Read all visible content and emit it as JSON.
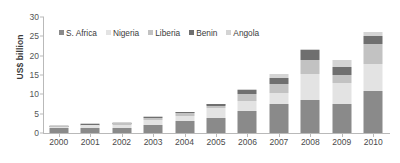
{
  "chart_data": {
    "type": "bar",
    "stacked": true,
    "title": "",
    "subtitle": "",
    "xlabel": "",
    "ylabel": "US$ billion",
    "ylim": [
      0,
      30
    ],
    "yticks": [
      0,
      5,
      10,
      15,
      20,
      25,
      30
    ],
    "grid": false,
    "legend_position": "top-left-inside",
    "categories": [
      "2000",
      "2001",
      "2002",
      "2003",
      "2004",
      "2005",
      "2006",
      "2007",
      "2008",
      "2009",
      "2010"
    ],
    "series": [
      {
        "name": "S. Africa",
        "color": "#8a8a8a",
        "values": [
          1.3,
          1.3,
          1.3,
          2.1,
          3.0,
          3.9,
          5.7,
          7.4,
          8.6,
          7.4,
          10.8
        ]
      },
      {
        "name": "Nigeria",
        "color": "#e3e3e3",
        "values": [
          0.3,
          0.7,
          0.9,
          1.3,
          1.5,
          2.6,
          2.6,
          2.9,
          6.6,
          5.6,
          7.0
        ]
      },
      {
        "name": "Liberia",
        "color": "#c2c2c2",
        "values": [
          0.2,
          0.2,
          0.3,
          0.5,
          0.6,
          0.5,
          1.9,
          2.4,
          3.6,
          2.0,
          5.1
        ]
      },
      {
        "name": "Benin",
        "color": "#6f6f6f",
        "values": [
          0.1,
          0.2,
          0.2,
          0.3,
          0.3,
          0.4,
          1.0,
          1.5,
          2.6,
          2.2,
          2.3
        ]
      },
      {
        "name": "Angola",
        "color": "#d4d4d4",
        "values": [
          0.1,
          0.1,
          0.1,
          0.1,
          0.1,
          0.1,
          0.2,
          1.0,
          0.4,
          1.8,
          1.0
        ]
      }
    ],
    "totals": [
      2.0,
      2.5,
      2.8,
      4.3,
      5.5,
      7.5,
      11.4,
      15.2,
      21.8,
      19.0,
      26.2
    ]
  },
  "axis": {
    "y_label": "US$ billion",
    "y_tick_labels": [
      "0",
      "5",
      "10",
      "15",
      "20",
      "25",
      "30"
    ]
  }
}
